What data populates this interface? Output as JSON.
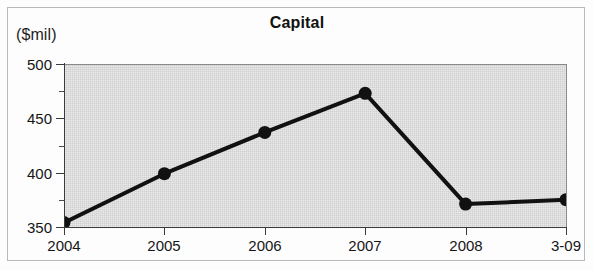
{
  "figure": {
    "unit_label": "($mil)",
    "title": "Capital",
    "border_color": "#b9b9b9",
    "plot_background": "#e9e9e9",
    "line_color": "#111111",
    "marker_color": "#111111"
  },
  "chart_data": {
    "type": "line",
    "title": "Capital",
    "xlabel": "",
    "ylabel": "($mil)",
    "categories": [
      "2004",
      "2005",
      "2006",
      "2007",
      "2008",
      "3-09"
    ],
    "values": [
      355,
      400,
      438,
      474,
      372,
      376
    ],
    "series": [
      {
        "name": "Capital",
        "values": [
          355,
          400,
          438,
          474,
          372,
          376
        ]
      }
    ],
    "ylim": [
      350,
      500
    ],
    "y_major_ticks": [
      350,
      400,
      450,
      500
    ],
    "y_minor_ticks": [
      375,
      425,
      475
    ],
    "y_tick_labels": [
      "350",
      "400",
      "450",
      "500"
    ],
    "grid": false,
    "legend": false,
    "marker": "circle"
  }
}
